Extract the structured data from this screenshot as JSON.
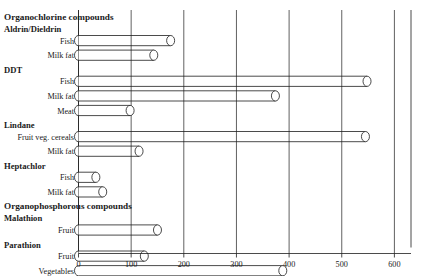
{
  "chart_data": {
    "type": "bar",
    "orientation": "horizontal",
    "title": "",
    "xlabel": "",
    "ylabel": "",
    "xlim": [
      0,
      620
    ],
    "grid": true,
    "legend": false,
    "tick_labels": [
      "0",
      "100",
      "200",
      "300",
      "400",
      "500",
      "600"
    ],
    "ticks": [
      0,
      100,
      200,
      300,
      400,
      500,
      600
    ],
    "sections": [
      {
        "heading": "Organochlorine compounds",
        "groups": [
          {
            "name": "Aldrin/Dieldrin",
            "items": [
              {
                "label": "Fish",
                "value": 175
              },
              {
                "label": "Milk fat",
                "value": 143
              }
            ]
          },
          {
            "name": "DDT",
            "items": [
              {
                "label": "Fish",
                "value": 548
              },
              {
                "label": "Milk fat",
                "value": 374
              },
              {
                "label": "Meat",
                "value": 98
              }
            ]
          },
          {
            "name": "Lindane",
            "items": [
              {
                "label": "Fruit veg. cereals",
                "value": 545
              },
              {
                "label": "Milk fat",
                "value": 115
              }
            ]
          },
          {
            "name": "Heptachlor",
            "items": [
              {
                "label": "Fish",
                "value": 33
              },
              {
                "label": "Milk fat",
                "value": 46
              }
            ]
          }
        ]
      },
      {
        "heading": "Organophosphorous compounds",
        "groups": [
          {
            "name": "Malathion",
            "items": [
              {
                "label": "Fruit",
                "value": 150
              }
            ]
          },
          {
            "name": "Parathion",
            "items": [
              {
                "label": "Fruit",
                "value": 125
              },
              {
                "label": "Vegetables",
                "value": 388
              }
            ]
          }
        ]
      }
    ]
  }
}
